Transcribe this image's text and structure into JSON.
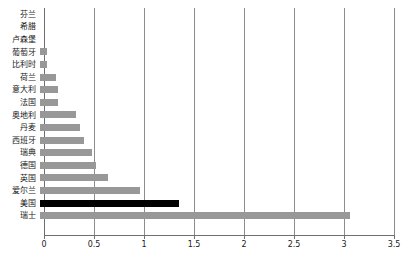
{
  "chart_data": {
    "type": "bar",
    "orientation": "horizontal",
    "title": "",
    "xlabel": "",
    "ylabel": "",
    "xlim": [
      0,
      3.5
    ],
    "xticks": [
      "0",
      "0.5",
      "1",
      "1.5",
      "2",
      "2.5",
      "3",
      "3.5"
    ],
    "xtick_values": [
      0,
      0.5,
      1,
      1.5,
      2,
      2.5,
      3,
      3.5
    ],
    "grid": true,
    "grid_axis": "x",
    "legend": false,
    "categories": [
      "芬兰",
      "希腊",
      "卢森堡",
      "葡萄牙",
      "比利时",
      "荷兰",
      "意大利",
      "法国",
      "奥地利",
      "丹麦",
      "西班牙",
      "瑞典",
      "德国",
      "英国",
      "爱尔兰",
      "美国",
      "瑞士"
    ],
    "values": [
      0,
      0,
      0,
      0.07,
      0.07,
      0.16,
      0.18,
      0.18,
      0.36,
      0.4,
      0.44,
      0.52,
      0.56,
      0.68,
      1.0,
      1.39,
      3.1
    ],
    "colors": [
      "#989898",
      "#989898",
      "#989898",
      "#989898",
      "#989898",
      "#989898",
      "#989898",
      "#989898",
      "#989898",
      "#989898",
      "#989898",
      "#989898",
      "#989898",
      "#989898",
      "#989898",
      "#000000",
      "#989898"
    ],
    "highlight_category": "美国",
    "highlight_color": "#000000",
    "bar_color": "#989898"
  }
}
